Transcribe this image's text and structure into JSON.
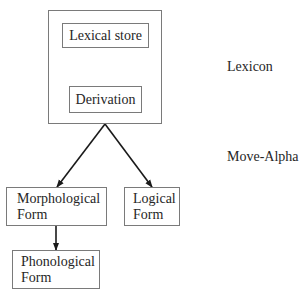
{
  "diagram": {
    "nodes": {
      "lexical_store": {
        "label": "Lexical store"
      },
      "derivation": {
        "label": "Derivation"
      },
      "morphological_form": {
        "line1": "Morphological",
        "line2": "Form"
      },
      "logical_form": {
        "line1": "Logical",
        "line2": "Form"
      },
      "phonological_form": {
        "line1": "Phonological",
        "line2": "Form"
      }
    },
    "side_labels": {
      "lexicon": "Lexicon",
      "move_alpha": "Move-Alpha"
    },
    "edges": [
      {
        "from": "lexical_store",
        "to": "derivation"
      },
      {
        "from": "lexicon_group",
        "to": "morphological_form"
      },
      {
        "from": "lexicon_group",
        "to": "logical_form"
      },
      {
        "from": "morphological_form",
        "to": "phonological_form"
      }
    ],
    "colors": {
      "box_border": "#7a7a7a",
      "arrow": "#1a1a1a",
      "text": "#262626"
    }
  }
}
